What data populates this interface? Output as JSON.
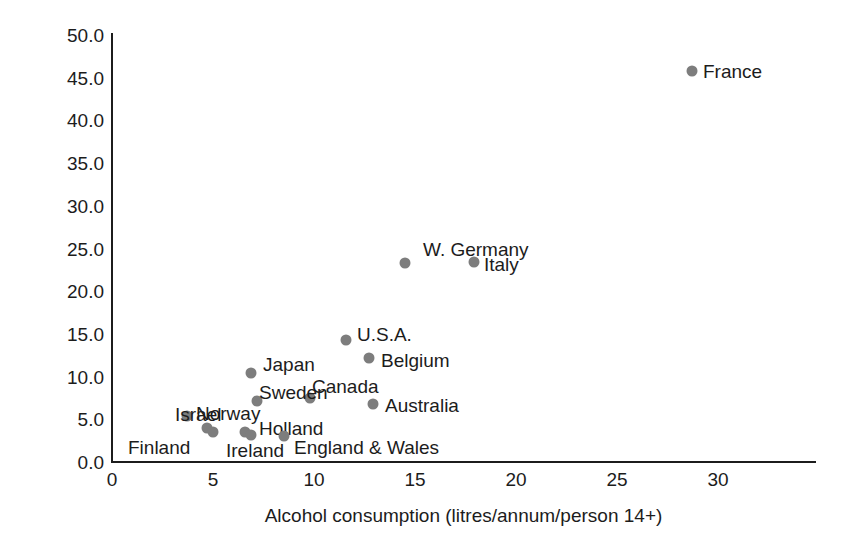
{
  "chart_data": {
    "type": "scatter",
    "title": "",
    "xlabel": "Alcohol consumption (litres/annum/person 14+)",
    "ylabel": "Death rate/100 0C0 population",
    "xlim": [
      0,
      34.8
    ],
    "ylim": [
      0,
      50
    ],
    "grid": false,
    "legend": "none",
    "marker_color": "#7d7d7d",
    "axis_color": "#1c1c1c",
    "xticks": [
      {
        "value": 0,
        "label": "0"
      },
      {
        "value": 5,
        "label": "5"
      },
      {
        "value": 10,
        "label": "10"
      },
      {
        "value": 15,
        "label": "15"
      },
      {
        "value": 20,
        "label": "20"
      },
      {
        "value": 25,
        "label": "25"
      },
      {
        "value": 30,
        "label": "30"
      }
    ],
    "yticks": [
      {
        "value": 0.0,
        "label": "0.0"
      },
      {
        "value": 5.0,
        "label": "5.0"
      },
      {
        "value": 10.0,
        "label": "10.0"
      },
      {
        "value": 15.0,
        "label": "15.0"
      },
      {
        "value": 20.0,
        "label": "20.0"
      },
      {
        "value": 25.0,
        "label": "25.0"
      },
      {
        "value": 30.0,
        "label": "30.0"
      },
      {
        "value": 35.0,
        "label": "35.0"
      },
      {
        "value": 40.0,
        "label": "40.0"
      },
      {
        "value": 45.0,
        "label": "45.0"
      },
      {
        "value": 50.0,
        "label": "50.0"
      }
    ],
    "points": [
      {
        "name": "France",
        "x": 28.7,
        "y": 45.8,
        "label_pos": "right"
      },
      {
        "name": "W. Germany",
        "x": 14.5,
        "y": 23.3,
        "label_pos": "above"
      },
      {
        "name": "Italy",
        "x": 17.9,
        "y": 23.4,
        "label_pos": "right"
      },
      {
        "name": "U.S.A.",
        "x": 11.6,
        "y": 14.3,
        "label_pos": "right"
      },
      {
        "name": "Belgium",
        "x": 12.7,
        "y": 12.2,
        "label_pos": "right"
      },
      {
        "name": "Japan",
        "x": 6.9,
        "y": 10.4,
        "label_pos": "right"
      },
      {
        "name": "Canada",
        "x": 9.8,
        "y": 7.5,
        "label_pos": "above"
      },
      {
        "name": "Australia",
        "x": 12.9,
        "y": 6.8,
        "label_pos": "right"
      },
      {
        "name": "Sweden",
        "x": 7.2,
        "y": 7.1,
        "label_pos": "left"
      },
      {
        "name": "Israel",
        "x": 3.7,
        "y": 5.4,
        "label_pos": "left"
      },
      {
        "name": "Norway",
        "x": 4.7,
        "y": 4.0,
        "label_pos": "right"
      },
      {
        "name": "Finland",
        "x": 5.0,
        "y": 3.5,
        "label_pos": "below-left"
      },
      {
        "name": "Ireland",
        "x": 6.6,
        "y": 3.5,
        "label_pos": "below"
      },
      {
        "name": "Holland",
        "x": 6.9,
        "y": 3.2,
        "label_pos": "right"
      },
      {
        "name": "England & Wales",
        "x": 8.5,
        "y": 3.1,
        "label_pos": "right"
      }
    ],
    "label_offsets": {
      "France": {
        "lx": 703,
        "ly": 71
      },
      "W. Germany": {
        "lx": 423,
        "ly": 249
      },
      "Italy": {
        "lx": 484,
        "ly": 264
      },
      "U.S.A.": {
        "lx": 357,
        "ly": 334
      },
      "Belgium": {
        "lx": 381,
        "ly": 360
      },
      "Japan": {
        "lx": 263,
        "ly": 364
      },
      "Canada": {
        "lx": 312,
        "ly": 386
      },
      "Australia": {
        "lx": 385,
        "ly": 405
      },
      "Sweden": {
        "lx": 259,
        "ly": 392
      },
      "Israel": {
        "lx": 175,
        "ly": 414
      },
      "Norway": {
        "lx": 196,
        "ly": 413
      },
      "Finland": {
        "lx": 128,
        "ly": 447
      },
      "Ireland": {
        "lx": 226,
        "ly": 450
      },
      "Holland": {
        "lx": 259,
        "ly": 428
      },
      "England & Wales": {
        "lx": 294,
        "ly": 447
      }
    }
  }
}
